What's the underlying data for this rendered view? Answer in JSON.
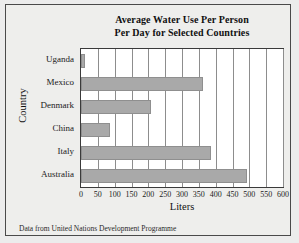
{
  "chart_data": {
    "type": "bar",
    "orientation": "horizontal",
    "title": "Average Water Use Per Person Per Day for Selected Countries",
    "title_lines": [
      "Average Water Use Per Person",
      "Per Day for Selected Countries"
    ],
    "categories": [
      "Uganda",
      "Mexico",
      "Denmark",
      "China",
      "Italy",
      "Australia"
    ],
    "values": [
      12,
      361,
      208,
      86,
      386,
      493
    ],
    "xlabel": "Liters",
    "ylabel": "Country",
    "xlim": [
      0,
      600
    ],
    "xticks": [
      0,
      50,
      100,
      150,
      200,
      250,
      300,
      350,
      400,
      450,
      500,
      550,
      600
    ],
    "xtick_labels": [
      "0",
      "50",
      "100",
      "150",
      "200",
      "250",
      "300",
      "350",
      "400",
      "450",
      "500",
      "550",
      "600"
    ],
    "grid": "vertical",
    "legend": "none",
    "bar_color": "#a9a9a9",
    "plot_background": "#ffffff",
    "page_background": "#eeeeec"
  },
  "source_note": "Data from United Nations Development Programme"
}
